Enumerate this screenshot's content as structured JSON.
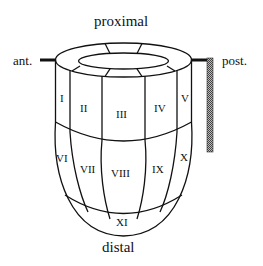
{
  "labels": {
    "proximal": "proximal",
    "distal": "distal",
    "anterior": "ant.",
    "posterior": "post."
  },
  "segments": {
    "I": "I",
    "II": "II",
    "III": "III",
    "IV": "IV",
    "V": "V",
    "VI": "VI",
    "VII": "VII",
    "VIII": "VIII",
    "IX": "IX",
    "X": "X",
    "XI": "XI"
  },
  "colors": {
    "stroke": "#111111",
    "hatch": "#666666"
  }
}
